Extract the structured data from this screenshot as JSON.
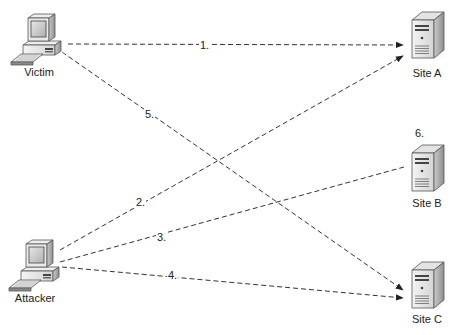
{
  "diagram": {
    "nodes": [
      {
        "id": "victim",
        "label": "Victim",
        "type": "workstation"
      },
      {
        "id": "attacker",
        "label": "Attacker",
        "type": "workstation"
      },
      {
        "id": "site_a",
        "label": "Site A",
        "type": "server"
      },
      {
        "id": "site_b",
        "label": "Site B",
        "type": "server"
      },
      {
        "id": "site_c",
        "label": "Site C",
        "type": "server"
      }
    ],
    "edges": [
      {
        "label": "1.",
        "from": "victim",
        "to": "site_a",
        "style": "dashed",
        "arrow": true
      },
      {
        "label": "2.",
        "from": "attacker",
        "to": "site_a",
        "style": "dashed",
        "arrow": true
      },
      {
        "label": "3.",
        "from": "attacker",
        "to": "site_b",
        "style": "dashed",
        "arrow": false
      },
      {
        "label": "4.",
        "from": "attacker",
        "to": "site_c",
        "style": "dashed",
        "arrow": true
      },
      {
        "label": "5.",
        "from": "victim",
        "to": "site_c",
        "style": "dashed",
        "arrow": true
      }
    ],
    "annotations": [
      {
        "label": "6.",
        "near": "site_b"
      }
    ]
  },
  "colors": {
    "line": "#333333",
    "background": "#ffffff"
  }
}
